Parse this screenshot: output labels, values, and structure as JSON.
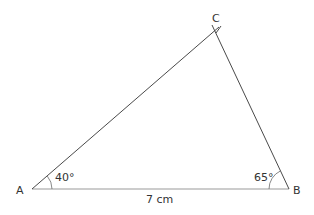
{
  "diagram": {
    "type": "triangle",
    "vertices": {
      "A": {
        "label": "A"
      },
      "B": {
        "label": "B"
      },
      "C": {
        "label": "C"
      }
    },
    "angles": {
      "A": "40°",
      "B": "65°"
    },
    "sides": {
      "AB": "7 cm"
    },
    "colors": {
      "line": "#4a4a4a",
      "base": "#9a9a9a",
      "text": "#333333",
      "background": "#ffffff"
    }
  }
}
